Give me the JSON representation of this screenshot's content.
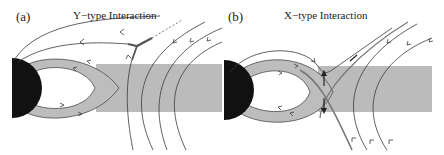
{
  "figure": {
    "panels": [
      {
        "id": "a",
        "label": "(a)",
        "title": "Y−type Interaction",
        "features": [
          "black-half-disk-planet",
          "gray-closed-loop-crescent",
          "gray-horizontal-band",
          "closed-field-lines-with-arrows",
          "open-field-lines-with-arrows",
          "y-point-thick-segment",
          "dashed-extension"
        ]
      },
      {
        "id": "b",
        "label": "(b)",
        "title": "X−type Interaction",
        "features": [
          "black-half-disk-planet",
          "gray-closed-loop-crescent",
          "gray-horizontal-band",
          "closed-field-lines-with-arrows",
          "open-field-lines-with-arrows",
          "x-point-crossing",
          "vertical-double-arrows"
        ]
      }
    ],
    "colors": {
      "line": "#3a3a3a",
      "band": "#b9b9b9",
      "loop": "#bdbdbd",
      "planet": "#111111",
      "xpoint": "#6a6a6a"
    }
  }
}
